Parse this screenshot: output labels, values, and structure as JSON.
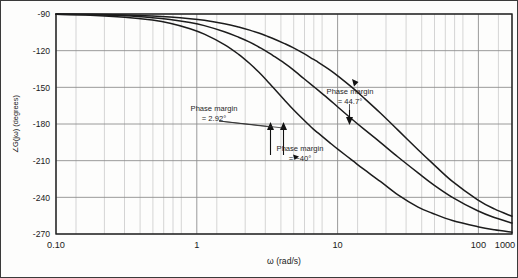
{
  "chart_data": {
    "type": "line",
    "title": "",
    "xlabel": "ω (rad/s)",
    "ylabel": "∠G(jω) (degrees)",
    "xscale": "log",
    "xlim": [
      0.1,
      1000
    ],
    "ylim": [
      -270,
      -90
    ],
    "grid": true,
    "grid_minor": true,
    "legend": "none",
    "xticks": [
      {
        "value": 0.1,
        "label": "0.10"
      },
      {
        "value": 1,
        "label": "1"
      },
      {
        "value": 10,
        "label": "10"
      },
      {
        "value": 100,
        "label": "100"
      },
      {
        "value": 1000,
        "label": "1000"
      }
    ],
    "yticks": [
      {
        "value": -90,
        "label": "-90"
      },
      {
        "value": -120,
        "label": "-120"
      },
      {
        "value": -150,
        "label": "-150"
      },
      {
        "value": -180,
        "label": "-180"
      },
      {
        "value": -210,
        "label": "-210"
      },
      {
        "value": -240,
        "label": "-240"
      },
      {
        "value": -270,
        "label": "-270"
      }
    ],
    "series": [
      {
        "name": "curve-low-gain",
        "points": [
          [
            0.1,
            -90.3
          ],
          [
            0.2,
            -91.0
          ],
          [
            0.4,
            -92.6
          ],
          [
            0.7,
            -95.0
          ],
          [
            1.0,
            -97.5
          ],
          [
            1.5,
            -102.0
          ],
          [
            2.0,
            -106.5
          ],
          [
            3.0,
            -115.0
          ],
          [
            4.0,
            -123.0
          ],
          [
            5.0,
            -130.5
          ],
          [
            6.0,
            -137.5
          ],
          [
            7.0,
            -144.0
          ],
          [
            8.0,
            -150.0
          ],
          [
            10.0,
            -160.0
          ],
          [
            12.0,
            -168.0
          ],
          [
            15.0,
            -177.0
          ],
          [
            18.0,
            -184.0
          ],
          [
            20.0,
            -187.5
          ],
          [
            25.0,
            -195.0
          ],
          [
            30.0,
            -201.0
          ],
          [
            40.0,
            -210.0
          ],
          [
            50.0,
            -217.0
          ],
          [
            70.0,
            -227.0
          ],
          [
            100.0,
            -238.0
          ],
          [
            150.0,
            -248.0
          ],
          [
            200.0,
            -253.0
          ],
          [
            300.0,
            -259.0
          ],
          [
            500.0,
            -264.0
          ],
          [
            700.0,
            -266.5
          ],
          [
            1000.0,
            -268.5
          ]
        ]
      },
      {
        "name": "curve-mid-gain",
        "points": [
          [
            0.1,
            -90.2
          ],
          [
            0.2,
            -90.6
          ],
          [
            0.4,
            -91.5
          ],
          [
            0.7,
            -93.0
          ],
          [
            1.0,
            -94.5
          ],
          [
            1.5,
            -97.0
          ],
          [
            2.0,
            -99.5
          ],
          [
            3.0,
            -104.5
          ],
          [
            4.0,
            -109.0
          ],
          [
            5.0,
            -113.0
          ],
          [
            6.0,
            -117.0
          ],
          [
            7.0,
            -120.5
          ],
          [
            8.0,
            -124.0
          ],
          [
            10.0,
            -130.0
          ],
          [
            12.0,
            -135.5
          ],
          [
            15.0,
            -143.0
          ],
          [
            18.0,
            -149.0
          ],
          [
            20.0,
            -152.5
          ],
          [
            25.0,
            -160.0
          ],
          [
            30.0,
            -166.5
          ],
          [
            40.0,
            -176.5
          ],
          [
            50.0,
            -184.0
          ],
          [
            70.0,
            -195.0
          ],
          [
            100.0,
            -207.0
          ],
          [
            150.0,
            -220.0
          ],
          [
            200.0,
            -229.0
          ],
          [
            300.0,
            -240.0
          ],
          [
            500.0,
            -251.0
          ],
          [
            700.0,
            -256.5
          ],
          [
            1000.0,
            -261.0
          ]
        ]
      },
      {
        "name": "curve-high-gain",
        "points": [
          [
            0.1,
            -90.1
          ],
          [
            0.2,
            -90.3
          ],
          [
            0.4,
            -90.8
          ],
          [
            0.7,
            -91.6
          ],
          [
            1.0,
            -92.4
          ],
          [
            1.5,
            -93.8
          ],
          [
            2.0,
            -95.2
          ],
          [
            3.0,
            -98.0
          ],
          [
            4.0,
            -100.7
          ],
          [
            5.0,
            -103.2
          ],
          [
            6.0,
            -105.6
          ],
          [
            7.0,
            -107.9
          ],
          [
            8.0,
            -110.0
          ],
          [
            10.0,
            -114.0
          ],
          [
            12.0,
            -117.5
          ],
          [
            15.0,
            -122.5
          ],
          [
            18.0,
            -127.0
          ],
          [
            20.0,
            -129.5
          ],
          [
            25.0,
            -135.5
          ],
          [
            30.0,
            -141.0
          ],
          [
            40.0,
            -150.5
          ],
          [
            50.0,
            -158.5
          ],
          [
            70.0,
            -171.0
          ],
          [
            100.0,
            -185.0
          ],
          [
            150.0,
            -201.0
          ],
          [
            200.0,
            -212.0
          ],
          [
            300.0,
            -227.0
          ],
          [
            500.0,
            -242.0
          ],
          [
            700.0,
            -249.5
          ],
          [
            1000.0,
            -255.5
          ]
        ]
      }
    ],
    "annotations": [
      {
        "name": "phase-margin-low",
        "line1": "Phase margin",
        "line2": "= 2.92°",
        "value": 2.92
      },
      {
        "name": "phase-margin-high",
        "line1": "Phase margin",
        "line2": "= 44.7°",
        "value": 44.7
      },
      {
        "name": "phase-margin-negative",
        "line1": "Phase margin",
        "line2": "= −40°",
        "value": -40
      }
    ]
  }
}
